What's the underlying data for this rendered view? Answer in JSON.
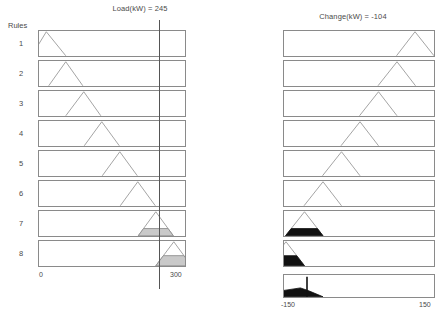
{
  "window": {
    "type": "fuzzy-rule-viewer"
  },
  "rules_label": "Rules",
  "rule_numbers": [
    "1",
    "2",
    "3",
    "4",
    "5",
    "6",
    "7",
    "8"
  ],
  "inputs": {
    "title": "Load(kW) = 245",
    "variable": "Load",
    "unit": "kW",
    "value": 245,
    "axis_min_label": "0",
    "axis_max_label": "300"
  },
  "outputs": {
    "title": "Change(kW) = -104",
    "variable": "Change",
    "unit": "kW",
    "value": -104,
    "axis_min_label": "-150",
    "axis_max_label": "150"
  },
  "colors": {
    "membership_outline": "#9a9a9a",
    "box_border": "#8a8a8a",
    "shadow": "#9a9a9a",
    "fired_fill_grey": "#c9c9c9",
    "fired_fill_black": "#111111",
    "input_line": "#555555",
    "text": "#4a4a4a",
    "background": "#ffffff"
  },
  "chart_data": {
    "type": "line",
    "xlabel": "",
    "ylabel": "",
    "grid": false,
    "legend": null,
    "panels": [
      {
        "name": "antecedent",
        "variable": "Load",
        "unit": "kW",
        "xlim": [
          0,
          300
        ],
        "ticks": [
          0,
          300
        ],
        "tick_labels": [
          "0",
          "300"
        ],
        "crisp_input": 245,
        "input_line_x": 245,
        "memberships": [
          {
            "rule": 1,
            "type": "triangle",
            "a": -15,
            "b": 15,
            "c": 55,
            "firing": 0.0,
            "fill": "none"
          },
          {
            "rule": 2,
            "type": "triangle",
            "a": 20,
            "b": 55,
            "c": 90,
            "firing": 0.0,
            "fill": "none"
          },
          {
            "rule": 3,
            "type": "triangle",
            "a": 55,
            "b": 92,
            "c": 127,
            "firing": 0.0,
            "fill": "none"
          },
          {
            "rule": 4,
            "type": "triangle",
            "a": 93,
            "b": 129,
            "c": 165,
            "firing": 0.0,
            "fill": "none"
          },
          {
            "rule": 5,
            "type": "triangle",
            "a": 130,
            "b": 166,
            "c": 202,
            "firing": 0.0,
            "fill": "none"
          },
          {
            "rule": 6,
            "type": "triangle",
            "a": 167,
            "b": 203,
            "c": 239,
            "firing": 0.0,
            "fill": "none"
          },
          {
            "rule": 7,
            "type": "triangle",
            "a": 204,
            "b": 240,
            "c": 276,
            "firing": 0.3,
            "fill": "grey"
          },
          {
            "rule": 8,
            "type": "triangle",
            "a": 240,
            "b": 277,
            "c": 313,
            "firing": 0.42,
            "fill": "grey"
          }
        ]
      },
      {
        "name": "consequent",
        "variable": "Change",
        "unit": "kW",
        "xlim": [
          -150,
          150
        ],
        "ticks": [
          -150,
          150
        ],
        "tick_labels": [
          "-150",
          "150"
        ],
        "crisp_output": -104,
        "memberships": [
          {
            "rule": 1,
            "type": "triangle",
            "a": 75,
            "b": 112,
            "c": 150,
            "firing": 0.0,
            "fill": "none"
          },
          {
            "rule": 2,
            "type": "triangle",
            "a": 38,
            "b": 76,
            "c": 113,
            "firing": 0.0,
            "fill": "none"
          },
          {
            "rule": 3,
            "type": "triangle",
            "a": 1,
            "b": 39,
            "c": 76,
            "firing": 0.0,
            "fill": "none"
          },
          {
            "rule": 4,
            "type": "triangle",
            "a": -36,
            "b": 2,
            "c": 39,
            "firing": 0.0,
            "fill": "none"
          },
          {
            "rule": 5,
            "type": "triangle",
            "a": -73,
            "b": -35,
            "c": 2,
            "firing": 0.0,
            "fill": "none"
          },
          {
            "rule": 6,
            "type": "triangle",
            "a": -110,
            "b": -72,
            "c": -35,
            "firing": 0.0,
            "fill": "none"
          },
          {
            "rule": 7,
            "type": "triangle",
            "a": -147,
            "b": -109,
            "c": -72,
            "firing": 0.3,
            "fill": "black"
          },
          {
            "rule": 8,
            "type": "triangle",
            "a": -184,
            "b": -146,
            "c": -109,
            "firing": 0.42,
            "fill": "black"
          }
        ],
        "aggregate": {
          "label": "aggregate output + centroid",
          "defuzzified": -104,
          "fill": "black",
          "centroid_line_x": -104
        }
      }
    ]
  }
}
